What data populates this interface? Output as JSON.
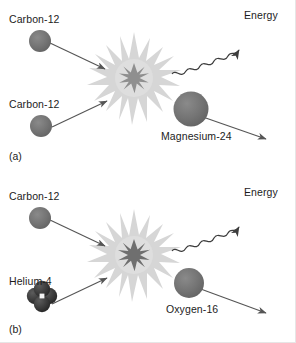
{
  "figure": {
    "background_color": "#ffffff",
    "nucleus_color": "#707070",
    "cluster_color": "#3a3a3a",
    "burst_outer_color": "#d9d9d9",
    "burst_inner_color": "#8c8c8c",
    "arrow_color": "#555555",
    "text_color": "#1c1c1c"
  },
  "panels": [
    {
      "tag": "(a)",
      "reaction": "Carbon-12 + Carbon-12 -> Magnesium-24 + Energy",
      "reactant_top_label": "Carbon-12",
      "reactant_bottom_label": "Carbon-12",
      "product_label": "Magnesium-24",
      "energy_label": "Energy"
    },
    {
      "tag": "(b)",
      "reaction": "Carbon-12 + Helium-4 -> Oxygen-16 + Energy",
      "reactant_top_label": "Carbon-12",
      "reactant_bottom_label": "Helium-4",
      "product_label": "Oxygen-16",
      "energy_label": "Energy"
    }
  ]
}
